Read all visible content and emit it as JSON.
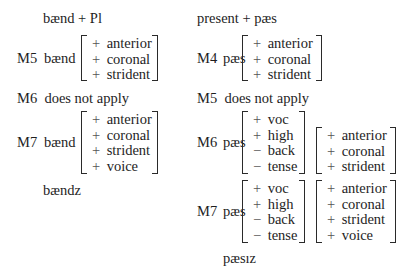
{
  "left": {
    "input": "bænd + Pl",
    "m5": {
      "label": "M5",
      "form": "bænd",
      "matrix": [
        {
          "sign": "+",
          "feature": "anterior"
        },
        {
          "sign": "+",
          "feature": "coronal"
        },
        {
          "sign": "+",
          "feature": "strident"
        }
      ]
    },
    "m6": {
      "text": "M6  does not apply"
    },
    "m7": {
      "label": "M7",
      "form": "bænd",
      "matrix": [
        {
          "sign": "+",
          "feature": "anterior"
        },
        {
          "sign": "+",
          "feature": "coronal"
        },
        {
          "sign": "+",
          "feature": "strident"
        },
        {
          "sign": "+",
          "feature": "voice"
        }
      ]
    },
    "output": "bændz"
  },
  "right": {
    "input": "present + pæs",
    "m4": {
      "label": "M4",
      "form": "pæs",
      "matrix": [
        {
          "sign": "+",
          "feature": "anterior"
        },
        {
          "sign": "+",
          "feature": "coronal"
        },
        {
          "sign": "+",
          "feature": "strident"
        }
      ]
    },
    "m5": {
      "text": "M5  does not apply"
    },
    "m6": {
      "label": "M6",
      "form": "pæs",
      "matrix1": [
        {
          "sign": "+",
          "feature": "voc"
        },
        {
          "sign": "+",
          "feature": "high"
        },
        {
          "sign": "−",
          "feature": "back"
        },
        {
          "sign": "−",
          "feature": "tense"
        }
      ],
      "matrix2": [
        {
          "sign": "+",
          "feature": "anterior"
        },
        {
          "sign": "+",
          "feature": "coronal"
        },
        {
          "sign": "+",
          "feature": "strident"
        }
      ]
    },
    "m7": {
      "label": "M7",
      "form": "pæs",
      "matrix1": [
        {
          "sign": "+",
          "feature": "voc"
        },
        {
          "sign": "+",
          "feature": "high"
        },
        {
          "sign": "−",
          "feature": "back"
        },
        {
          "sign": "−",
          "feature": "tense"
        }
      ],
      "matrix2": [
        {
          "sign": "+",
          "feature": "anterior"
        },
        {
          "sign": "+",
          "feature": "coronal"
        },
        {
          "sign": "+",
          "feature": "strident"
        },
        {
          "sign": "+",
          "feature": "voice"
        }
      ]
    },
    "output": "pæsız"
  }
}
